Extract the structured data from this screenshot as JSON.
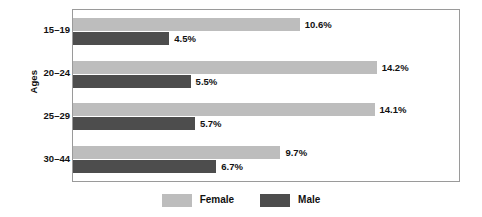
{
  "chart_data": {
    "type": "bar",
    "orientation": "horizontal",
    "title": "",
    "subtitle": "",
    "xlabel": "",
    "ylabel": "Ages",
    "categories": [
      "15–19",
      "20–24",
      "25–29",
      "30–44"
    ],
    "series": [
      {
        "name": "Female",
        "color": "#bdbdbd",
        "values": [
          10.6,
          14.2,
          14.1,
          9.7
        ],
        "labels": [
          "10.6%",
          "14.2%",
          "14.1%",
          "9.7%"
        ]
      },
      {
        "name": "Male",
        "color": "#4d4d4d",
        "values": [
          4.5,
          5.5,
          5.7,
          6.7
        ],
        "labels": [
          "4.5%",
          "5.5%",
          "5.7%",
          "6.7%"
        ]
      }
    ],
    "xlim": [
      0,
      18.05
    ],
    "grid": false,
    "legend": {
      "position": "bottom",
      "entries": [
        {
          "label": "Female",
          "color": "#bdbdbd"
        },
        {
          "label": "Male",
          "color": "#4d4d4d"
        }
      ]
    }
  },
  "axis": {
    "y_title": "Ages",
    "tick_labels": [
      "15–19",
      "20–24",
      "25–29",
      "30–44"
    ]
  },
  "legend": {
    "female_label": "Female",
    "male_label": "Male"
  },
  "colors": {
    "female": "#bdbdbd",
    "male": "#4d4d4d",
    "frame": "#9a9a9a",
    "background": "#ffffff",
    "text": "#111111"
  }
}
